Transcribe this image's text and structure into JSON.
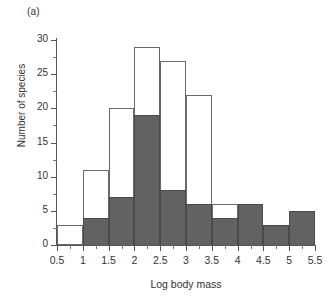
{
  "figure": {
    "panel_label": "(a)"
  },
  "chart_data": {
    "type": "bar",
    "title": "",
    "subtitle": "",
    "xlabel": "Log body mass",
    "ylabel": "Number of species",
    "xlim": [
      0.5,
      5.5
    ],
    "ylim": [
      0,
      30
    ],
    "grid": false,
    "legend_position": "none",
    "stacked": true,
    "bin_width": 0.5,
    "bin_edges": [
      0.5,
      1,
      1.5,
      2,
      2.5,
      3,
      3.5,
      4,
      4.5,
      5,
      5.5
    ],
    "categories": [
      "0.5-1",
      "1-1.5",
      "1.5-2",
      "2-2.5",
      "2.5-3",
      "3-3.5",
      "3.5-4",
      "4-4.5",
      "4.5-5",
      "5-5.5"
    ],
    "series": [
      {
        "name": "dark",
        "fill": "solid-gray",
        "values": [
          0,
          4,
          7,
          19,
          8,
          6,
          4,
          6,
          3,
          5
        ]
      },
      {
        "name": "light",
        "fill": "dotted",
        "values": [
          3,
          7,
          13,
          10,
          19,
          16,
          2,
          0,
          0,
          0
        ]
      }
    ],
    "totals": [
      3,
      11,
      20,
      29,
      27,
      22,
      6,
      6,
      3,
      5
    ],
    "x_ticks": [
      {
        "value": 0.5,
        "label": "0.5"
      },
      {
        "value": 1,
        "label": "1"
      },
      {
        "value": 1.5,
        "label": "1.5"
      },
      {
        "value": 2,
        "label": "2"
      },
      {
        "value": 2.5,
        "label": "2.5"
      },
      {
        "value": 3,
        "label": "3"
      },
      {
        "value": 3.5,
        "label": "3.5"
      },
      {
        "value": 4,
        "label": "4"
      },
      {
        "value": 4.5,
        "label": "4.5"
      },
      {
        "value": 5,
        "label": "5"
      },
      {
        "value": 5.5,
        "label": "5.5"
      }
    ],
    "y_ticks": [
      {
        "value": 0,
        "label": "0"
      },
      {
        "value": 5,
        "label": "5"
      },
      {
        "value": 10,
        "label": "10"
      },
      {
        "value": 15,
        "label": "15"
      },
      {
        "value": 20,
        "label": "20"
      },
      {
        "value": 25,
        "label": "25"
      },
      {
        "value": 30,
        "label": "30"
      }
    ],
    "y_minor_ticks": [
      2.5,
      7.5,
      12.5,
      17.5,
      22.5,
      27.5
    ],
    "colors": {
      "dark_fill": "#626262",
      "light_fill": "#ffffff",
      "dot_color": "#9d9d9d",
      "outline": "#6a6a6a",
      "axis": "#555555",
      "text": "#333333"
    }
  }
}
